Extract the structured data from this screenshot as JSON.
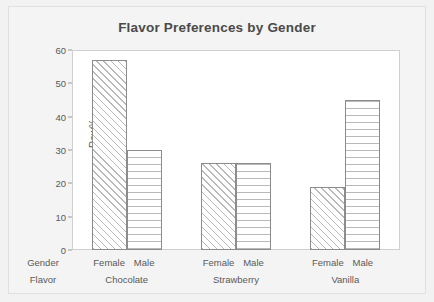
{
  "chart_data": {
    "type": "bar",
    "title": "Flavor Preferences by Gender",
    "xlabel": "",
    "ylabel": "Row%",
    "ylim": [
      0,
      60
    ],
    "yticks": [
      0,
      10,
      20,
      30,
      40,
      50,
      60
    ],
    "grid": false,
    "legend": "none",
    "categories": [
      "Chocolate",
      "Strawberry",
      "Vanilla"
    ],
    "subcategories": [
      "Female",
      "Male"
    ],
    "series": [
      {
        "name": "Female",
        "values": [
          57,
          26,
          19
        ]
      },
      {
        "name": "Male",
        "values": [
          30,
          26,
          45
        ]
      }
    ],
    "groups": [
      {
        "flavor": "Chocolate",
        "bars": [
          {
            "gender": "Female",
            "value": 57,
            "pattern": "diagonal-hatch"
          },
          {
            "gender": "Male",
            "value": 30,
            "pattern": "horizontal-lines"
          }
        ]
      },
      {
        "flavor": "Strawberry",
        "bars": [
          {
            "gender": "Female",
            "value": 26,
            "pattern": "diagonal-hatch"
          },
          {
            "gender": "Male",
            "value": 26,
            "pattern": "horizontal-lines"
          }
        ]
      },
      {
        "flavor": "Vanilla",
        "bars": [
          {
            "gender": "Female",
            "value": 19,
            "pattern": "diagonal-hatch"
          },
          {
            "gender": "Male",
            "value": 45,
            "pattern": "horizontal-lines"
          }
        ]
      }
    ],
    "axis_row_headers": {
      "gender": "Gender",
      "flavor": "Flavor"
    },
    "colors": {
      "background": "#f2f2f2",
      "plot_background": "#ffffff",
      "bar_outline": "#8c8c8c",
      "hatch": "#b9b9b9",
      "text": "#595959",
      "title_text": "#4a4a4a",
      "frame": "#cfcfcf"
    }
  }
}
